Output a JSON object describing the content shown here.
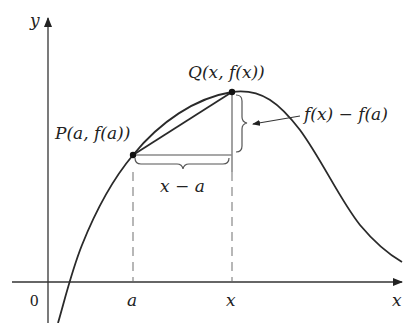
{
  "diagram": {
    "type": "secant-line-figure",
    "axes": {
      "x_label": "x",
      "y_label": "y",
      "origin_label": "0",
      "tick_labels": [
        "a",
        "x"
      ]
    },
    "points": {
      "P": {
        "label": "P(a, f(a))"
      },
      "Q": {
        "label": "Q(x, f(x))"
      }
    },
    "annotations": {
      "horizontal_difference": "x − a",
      "vertical_difference": "f(x) − f(a)"
    },
    "colors": {
      "curve": "#2a2a2a",
      "axis": "#333333",
      "guide": "#8a8a8a"
    }
  }
}
